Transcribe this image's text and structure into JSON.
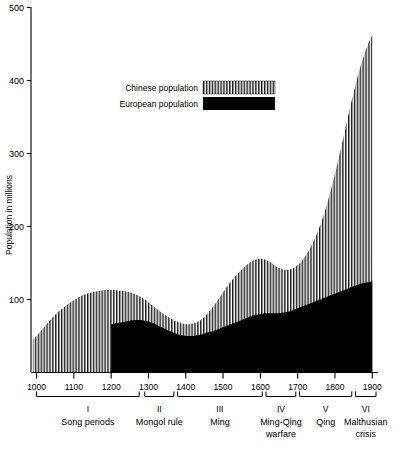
{
  "chart_data": {
    "type": "area",
    "title": "",
    "xlabel": "",
    "ylabel": "Population in millions",
    "xlim": [
      985,
      1910
    ],
    "ylim": [
      0,
      500
    ],
    "grid": false,
    "legend_position": "upper-center",
    "y_ticks": [
      100,
      200,
      300,
      400,
      500
    ],
    "x_ticks": [
      1000,
      1100,
      1200,
      1300,
      1400,
      1500,
      1600,
      1700,
      1800,
      1900
    ],
    "series": [
      {
        "name": "Chinese population",
        "fill": "vertical-hatch",
        "x": [
          990,
          1000,
          1010,
          1020,
          1030,
          1040,
          1050,
          1060,
          1070,
          1080,
          1090,
          1100,
          1110,
          1120,
          1130,
          1140,
          1150,
          1160,
          1170,
          1180,
          1190,
          1200,
          1210,
          1220,
          1230,
          1240,
          1250,
          1260,
          1270,
          1280,
          1290,
          1300,
          1310,
          1320,
          1330,
          1340,
          1350,
          1360,
          1370,
          1380,
          1390,
          1400,
          1410,
          1420,
          1430,
          1440,
          1450,
          1460,
          1470,
          1480,
          1490,
          1500,
          1510,
          1520,
          1530,
          1540,
          1550,
          1560,
          1570,
          1580,
          1590,
          1600,
          1610,
          1620,
          1630,
          1640,
          1650,
          1660,
          1670,
          1680,
          1690,
          1700,
          1710,
          1720,
          1730,
          1740,
          1750,
          1760,
          1770,
          1780,
          1790,
          1800,
          1810,
          1820,
          1830,
          1840,
          1850,
          1860,
          1870,
          1880,
          1890,
          1900
        ],
        "values": [
          45,
          50,
          56,
          62,
          68,
          74,
          79,
          84,
          88,
          92,
          96,
          99,
          102,
          105,
          107,
          109,
          110,
          111,
          112,
          113,
          113,
          113,
          113,
          112,
          112,
          111,
          110,
          108,
          106,
          103,
          100,
          96,
          92,
          88,
          84,
          80,
          77,
          74,
          71,
          69,
          67,
          66,
          66,
          67,
          69,
          72,
          76,
          82,
          88,
          95,
          102,
          110,
          117,
          124,
          130,
          136,
          141,
          146,
          150,
          153,
          155,
          156,
          155,
          153,
          150,
          146,
          143,
          141,
          140,
          141,
          143,
          147,
          152,
          159,
          167,
          177,
          188,
          201,
          216,
          233,
          252,
          272,
          294,
          316,
          339,
          362,
          384,
          404,
          422,
          438,
          452,
          462
        ]
      },
      {
        "name": "European population",
        "fill": "solid-black",
        "x": [
          1200,
          1210,
          1220,
          1230,
          1240,
          1250,
          1260,
          1270,
          1280,
          1290,
          1300,
          1310,
          1320,
          1330,
          1340,
          1350,
          1360,
          1370,
          1380,
          1390,
          1400,
          1410,
          1420,
          1430,
          1440,
          1450,
          1460,
          1470,
          1480,
          1490,
          1500,
          1510,
          1520,
          1530,
          1540,
          1550,
          1560,
          1570,
          1580,
          1590,
          1600,
          1610,
          1620,
          1630,
          1640,
          1650,
          1660,
          1670,
          1680,
          1690,
          1700,
          1710,
          1720,
          1730,
          1740,
          1750,
          1760,
          1770,
          1780,
          1790,
          1800,
          1810,
          1820,
          1830,
          1840,
          1850,
          1860,
          1870,
          1880,
          1890,
          1900
        ],
        "values": [
          66,
          67,
          68,
          69,
          70,
          71,
          72,
          72,
          72,
          71,
          70,
          68,
          66,
          63,
          61,
          58,
          56,
          54,
          52,
          51,
          50,
          50,
          50,
          51,
          52,
          53,
          55,
          56,
          58,
          60,
          62,
          64,
          66,
          68,
          70,
          72,
          74,
          76,
          78,
          79,
          80,
          81,
          81,
          81,
          81,
          81,
          82,
          83,
          84,
          86,
          88,
          90,
          92,
          94,
          96,
          98,
          100,
          102,
          104,
          106,
          108,
          110,
          112,
          114,
          116,
          118,
          120,
          122,
          123,
          124,
          125
        ]
      }
    ],
    "periods": [
      {
        "roman": "I",
        "name": "Song periods",
        "start": 1000,
        "end": 1275
      },
      {
        "roman": "II",
        "name": "Mongol rule",
        "start": 1290,
        "end": 1368
      },
      {
        "roman": "III",
        "name": "Ming",
        "start": 1378,
        "end": 1605
      },
      {
        "roman": "IV",
        "name": "Ming-Qing warfare",
        "name_line1": "Ming-Qing",
        "name_line2": "warfare",
        "start": 1615,
        "end": 1695
      },
      {
        "roman": "V",
        "name": "Qing",
        "start": 1705,
        "end": 1845
      },
      {
        "roman": "VI",
        "name": "Malthusian crisis",
        "name_line1": "Malthusian",
        "name_line2": "crisis",
        "start": 1855,
        "end": 1910
      }
    ]
  },
  "legend": {
    "items": [
      {
        "label": "Chinese population",
        "swatch": "vertical-hatch"
      },
      {
        "label": "European population",
        "swatch": "solid-black"
      }
    ]
  },
  "axis": {
    "y_title": "Population in millions",
    "y_tick_labels": [
      "500",
      "400",
      "300",
      "200",
      "100"
    ],
    "x_tick_labels": [
      "1000",
      "1100",
      "1200",
      "1300",
      "1400",
      "1500",
      "1600",
      "1700",
      "1800",
      "1900"
    ]
  },
  "colors": {
    "foreground": "#000000",
    "background": "#ffffff",
    "hatch": "#1a1a1a"
  }
}
